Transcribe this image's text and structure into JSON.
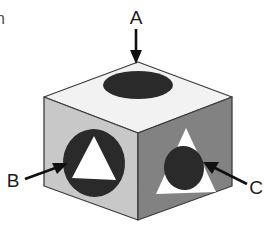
{
  "figure": {
    "background_color": "#ffffff",
    "width": 269,
    "height": 233,
    "edge_text_fragment": "n"
  },
  "colors": {
    "top_face": "#f2f2f2",
    "left_face": "#c8c8c8",
    "right_face": "#828282",
    "shape_dark": "#2a2a2a",
    "shape_light": "#ffffff",
    "outline": "#3c3c3c",
    "arrow": "#101010",
    "label": "#1d1d1d"
  },
  "cube": {
    "faces": [
      {
        "id": "top-face",
        "name": "top-face",
        "fill": "#f2f2f2",
        "shape_inner": "ellipse",
        "shape_inner_fill": "#2a2a2a",
        "description": "Light top face with a dark elliptical hole"
      },
      {
        "id": "left-face",
        "name": "left-face",
        "fill": "#c8c8c8",
        "shape_inner": "circle-with-triangle",
        "shape_inner_fill": "#2a2a2a",
        "shape_core_fill": "#ffffff",
        "description": "Medium gray left face with a dark circle containing a white triangle"
      },
      {
        "id": "right-face",
        "name": "right-face",
        "fill": "#828282",
        "shape_inner": "triangle-with-circle",
        "shape_inner_fill": "#ffffff",
        "shape_core_fill": "#2a2a2a",
        "description": "Dark gray right face with a white triangle containing a dark circle"
      }
    ]
  },
  "annotations": [
    {
      "id": "annotation-a",
      "label": "A",
      "points_to": "top-face",
      "arrow_direction": "down",
      "label_x": 136,
      "label_y": 19
    },
    {
      "id": "annotation-b",
      "label": "B",
      "points_to": "left-face",
      "arrow_direction": "up-right",
      "label_x": 13,
      "label_y": 182
    },
    {
      "id": "annotation-c",
      "label": "C",
      "points_to": "right-face",
      "arrow_direction": "up-left",
      "label_x": 253,
      "label_y": 189
    }
  ]
}
